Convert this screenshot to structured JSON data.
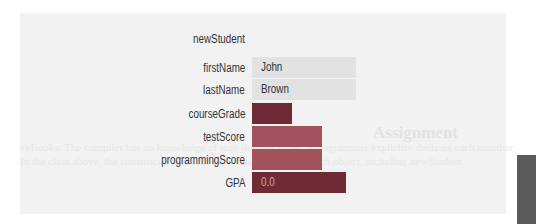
{
  "background": {
    "ghost_title": "Assignment",
    "ghost_line1": "zyBooks: The compiler has no knowledge of user-defined types; a programmer explicitly declares each member",
    "ghost_line2": "In the class above, the constructor initializes the data members of each object, including newStudent"
  },
  "object": {
    "name": "newStudent",
    "fields": [
      {
        "label": "firstName",
        "value": "John",
        "style": "light",
        "width": 104
      },
      {
        "label": "lastName",
        "value": "Brown",
        "style": "light",
        "width": 104
      },
      {
        "label": "courseGrade",
        "value": "",
        "style": "dark",
        "width": 40
      },
      {
        "label": "testScore",
        "value": "",
        "style": "mid",
        "width": 70
      },
      {
        "label": "programmingScore",
        "value": "",
        "style": "mid",
        "width": 70
      },
      {
        "label": "GPA",
        "value": "0.0",
        "style": "dark",
        "width": 94
      }
    ]
  },
  "colors": {
    "panel": "#f2f2f2",
    "light_bar": "#e2e2e2",
    "dark_bar": "#6e2b35",
    "mid_bar": "#a2525c",
    "label_text": "#333333"
  }
}
